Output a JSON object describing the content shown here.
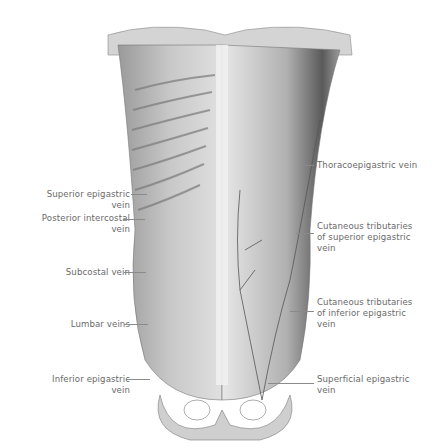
{
  "figure": {
    "labels_left": [
      {
        "id": "superior-epigastric-vein",
        "line1": "Superior epigastric",
        "line2": "vein"
      },
      {
        "id": "posterior-intercostal-vein",
        "line1": "Posterior intercostal",
        "line2": "vein"
      },
      {
        "id": "subcostal-vein",
        "line1": "Subcostal vein",
        "line2": ""
      },
      {
        "id": "lumbar-veins",
        "line1": "Lumbar veins",
        "line2": ""
      },
      {
        "id": "inferior-epigastric-vein",
        "line1": "Inferior epigastric",
        "line2": "vein"
      }
    ],
    "labels_right": [
      {
        "id": "thoracoepigastric-vein",
        "line1": "Thoracoepigastric vein",
        "line2": "",
        "line3": ""
      },
      {
        "id": "cutaneous-tributaries-superior",
        "line1": "Cutaneous tributaries",
        "line2": "of superior epigastric",
        "line3": "vein"
      },
      {
        "id": "cutaneous-tributaries-inferior",
        "line1": "Cutaneous tributaries",
        "line2": "of inferior epigastric",
        "line3": "vein"
      },
      {
        "id": "superficial-epigastric-vein",
        "line1": "Superficial epigastric",
        "line2": "vein",
        "line3": ""
      }
    ]
  }
}
